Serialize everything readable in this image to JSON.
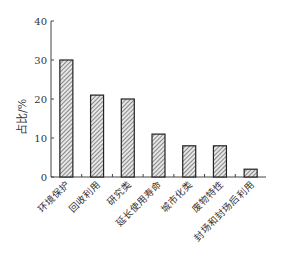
{
  "chart_data": {
    "type": "bar",
    "title": "",
    "xlabel": "",
    "ylabel": "占比/%",
    "ylim": [
      0,
      40
    ],
    "yticks": [
      0,
      10,
      20,
      30,
      40
    ],
    "grid": false,
    "legend": null,
    "categories": [
      "环境保护",
      "回收利用",
      "研究类",
      "延长使用寿命",
      "城市化类",
      "废物特性",
      "封场和封场后利用"
    ],
    "values": [
      30,
      21,
      20,
      11,
      8,
      8,
      2
    ],
    "bar_fill": "hatched",
    "colors": {
      "bar_stroke": "#222222",
      "hatch": "#555555",
      "axis": "#444444"
    }
  }
}
